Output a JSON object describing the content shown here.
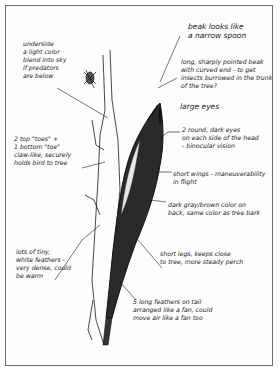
{
  "diagram": {
    "colors": {
      "ink": "#1a1a1a",
      "paper": "#fdfdfd",
      "border": "#6a6a6a"
    },
    "annotations": [
      {
        "id": "underside",
        "text": "underside\na light color\nblend into sky\nif predators\nare below"
      },
      {
        "id": "beak-spoon",
        "text": "beak looks like\na narrow spoon"
      },
      {
        "id": "beak-long",
        "text": "long, sharply pointed beak\nwith curved end - to get\ninsects burrowed in the trunk\nof the tree?"
      },
      {
        "id": "large-eyes",
        "text": "large eyes"
      },
      {
        "id": "eyes-detail",
        "text": "2 round, dark eyes\non each side of the head\n- binocular vision"
      },
      {
        "id": "toes",
        "text": "2 top \"toes\" +\n1 bottom \"toe\"\nclaw-like, securely\nholds bird to tree"
      },
      {
        "id": "wings",
        "text": "short wings - maneuverability\nin flight"
      },
      {
        "id": "back-color",
        "text": "dark gray/brown color on\nback, same color as tree bark"
      },
      {
        "id": "feathers",
        "text": "lots of tiny,\nwhite feathers -\nvery dense, could\nbe warm"
      },
      {
        "id": "legs",
        "text": "short legs, keeps close\nto tree, more steady perch"
      },
      {
        "id": "tail",
        "text": "5 long feathers on tail\narranged like a fan, could\nmove air like a fan too"
      }
    ]
  }
}
